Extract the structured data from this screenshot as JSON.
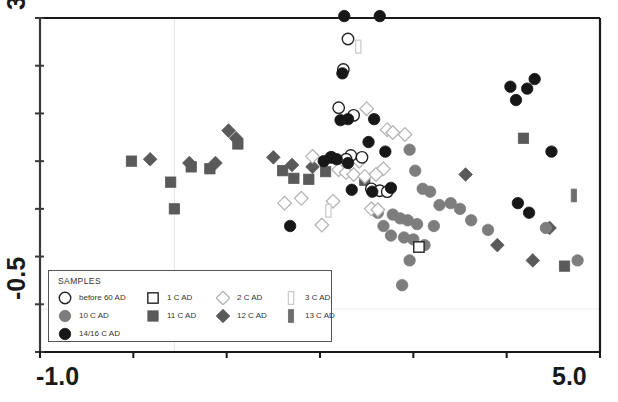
{
  "figure": {
    "top_fragment": "",
    "frame": {
      "left": 40,
      "top": 18,
      "right": 600,
      "bottom": 352
    }
  },
  "axes": {
    "x": {
      "min_label": "-1.0",
      "max_label": "5.0",
      "min": -1.0,
      "max": 5.0,
      "ticks": 7
    },
    "y": {
      "max_label": "3.0",
      "min_label": "-0.5",
      "min": -0.5,
      "max": 3.0,
      "ticks": 8
    },
    "gridline_x": 0.44,
    "gridline_y": -0.05
  },
  "legend": {
    "title": "SAMPLES",
    "items": [
      {
        "label": "before 60 AD",
        "key": "before60",
        "marker": "open-circle",
        "fill": "#ffffff",
        "stroke": "#222222"
      },
      {
        "label": "1 C AD",
        "key": "c1",
        "marker": "open-square",
        "fill": "#ffffff",
        "stroke": "#222222"
      },
      {
        "label": "2 C AD",
        "key": "c2",
        "marker": "open-diamond",
        "fill": "#ffffff",
        "stroke": "#b5b5b5"
      },
      {
        "label": "3 C AD",
        "key": "c3",
        "marker": "open-vbar",
        "fill": "#ffffff",
        "stroke": "#cccccc"
      },
      {
        "label": "10 C AD",
        "key": "c10",
        "marker": "circle",
        "fill": "#7d7d7d",
        "stroke": "#7d7d7d"
      },
      {
        "label": "11 C AD",
        "key": "c11",
        "marker": "square",
        "fill": "#5a5a5a",
        "stroke": "#5a5a5a"
      },
      {
        "label": "12 C AD",
        "key": "c12",
        "marker": "diamond",
        "fill": "#5a5a5a",
        "stroke": "#5a5a5a"
      },
      {
        "label": "13 C AD",
        "key": "c13",
        "marker": "vbar",
        "fill": "#6e6e6e",
        "stroke": "#6e6e6e"
      },
      {
        "label": "14/16 C AD",
        "key": "c1416",
        "marker": "circle",
        "fill": "#171717",
        "stroke": "#171717"
      }
    ]
  },
  "chart_data": {
    "type": "scatter",
    "title": "",
    "xlabel": "",
    "ylabel": "",
    "xlim": [
      -1.0,
      5.0
    ],
    "ylim": [
      -0.5,
      3.0
    ],
    "grid": true,
    "legend_position": "bottom-left",
    "series": [
      {
        "name": "before 60 AD",
        "key": "before60",
        "marker": "open-circle",
        "fill": "#ffffff",
        "stroke": "#222222",
        "points": [
          [
            2.3,
            2.78
          ],
          [
            2.25,
            2.46
          ],
          [
            2.2,
            2.06
          ],
          [
            2.36,
            1.98
          ],
          [
            2.33,
            1.56
          ],
          [
            2.45,
            1.54
          ],
          [
            2.12,
            1.54
          ],
          [
            2.28,
            1.52
          ],
          [
            2.55,
            1.21
          ],
          [
            2.64,
            1.19
          ],
          [
            2.72,
            1.18
          ]
        ]
      },
      {
        "name": "1 C AD",
        "key": "c1",
        "marker": "open-square",
        "fill": "#ffffff",
        "stroke": "#222222",
        "points": [
          [
            3.06,
            0.6
          ]
        ]
      },
      {
        "name": "2 C AD",
        "key": "c2",
        "marker": "open-diamond",
        "fill": "#ffffff",
        "stroke": "#b5b5b5",
        "points": [
          [
            2.5,
            2.05
          ],
          [
            2.72,
            1.83
          ],
          [
            2.78,
            1.8
          ],
          [
            2.91,
            1.78
          ],
          [
            1.92,
            1.55
          ],
          [
            2.42,
            1.5
          ],
          [
            2.2,
            1.41
          ],
          [
            2.28,
            1.38
          ],
          [
            2.36,
            1.36
          ],
          [
            1.8,
            1.11
          ],
          [
            2.14,
            1.08
          ],
          [
            2.55,
            1.0
          ],
          [
            2.62,
            0.99
          ],
          [
            2.68,
            1.42
          ],
          [
            2.48,
            1.34
          ],
          [
            2.02,
            0.83
          ],
          [
            1.62,
            1.06
          ],
          [
            2.6,
            1.36
          ]
        ]
      },
      {
        "name": "3 C AD",
        "key": "c3",
        "marker": "open-vbar",
        "fill": "#ffffff",
        "stroke": "#cccccc",
        "points": [
          [
            2.41,
            2.7
          ],
          [
            2.09,
            0.98
          ]
        ]
      },
      {
        "name": "10 C AD",
        "key": "c10",
        "marker": "circle",
        "fill": "#7d7d7d",
        "stroke": "#7d7d7d",
        "points": [
          [
            2.96,
            1.62
          ],
          [
            3.02,
            1.4
          ],
          [
            3.1,
            1.21
          ],
          [
            3.18,
            1.18
          ],
          [
            3.28,
            1.04
          ],
          [
            3.4,
            1.06
          ],
          [
            3.5,
            1.0
          ],
          [
            2.78,
            0.94
          ],
          [
            2.86,
            0.9
          ],
          [
            2.94,
            0.88
          ],
          [
            3.04,
            0.84
          ],
          [
            2.68,
            0.82
          ],
          [
            2.76,
            0.72
          ],
          [
            2.9,
            0.7
          ],
          [
            3.0,
            0.68
          ],
          [
            3.22,
            0.82
          ],
          [
            3.12,
            0.62
          ],
          [
            2.96,
            0.46
          ],
          [
            2.88,
            0.2
          ],
          [
            4.42,
            0.8
          ],
          [
            4.76,
            0.46
          ],
          [
            3.8,
            0.78
          ],
          [
            3.62,
            0.88
          ],
          [
            2.62,
            0.96
          ]
        ]
      },
      {
        "name": "11 C AD",
        "key": "c11",
        "marker": "square",
        "fill": "#5a5a5a",
        "stroke": "#5a5a5a",
        "points": [
          [
            -0.02,
            1.5
          ],
          [
            0.4,
            1.28
          ],
          [
            0.44,
            1.0
          ],
          [
            1.12,
            1.68
          ],
          [
            1.6,
            1.4
          ],
          [
            1.72,
            1.32
          ],
          [
            2.06,
            1.39
          ],
          [
            2.48,
            1.3
          ],
          [
            4.18,
            1.74
          ],
          [
            4.62,
            0.4
          ],
          [
            0.82,
            1.42
          ],
          [
            1.88,
            1.31
          ],
          [
            0.62,
            1.44
          ]
        ]
      },
      {
        "name": "12 C AD",
        "key": "c12",
        "marker": "diamond",
        "fill": "#5a5a5a",
        "stroke": "#5a5a5a",
        "points": [
          [
            0.18,
            1.52
          ],
          [
            0.6,
            1.48
          ],
          [
            1.02,
            1.82
          ],
          [
            1.1,
            1.74
          ],
          [
            1.5,
            1.54
          ],
          [
            1.7,
            1.46
          ],
          [
            1.92,
            1.44
          ],
          [
            0.88,
            1.48
          ],
          [
            3.56,
            1.36
          ],
          [
            4.46,
            0.8
          ],
          [
            3.9,
            0.62
          ],
          [
            4.28,
            0.46
          ]
        ]
      },
      {
        "name": "13 C AD",
        "key": "c13",
        "marker": "vbar",
        "fill": "#6e6e6e",
        "stroke": "#6e6e6e",
        "points": [
          [
            4.72,
            1.14
          ]
        ]
      },
      {
        "name": "14/16 C AD",
        "key": "c1416",
        "marker": "circle",
        "fill": "#171717",
        "stroke": "#171717",
        "points": [
          [
            2.26,
            3.02
          ],
          [
            2.64,
            3.02
          ],
          [
            2.24,
            2.42
          ],
          [
            2.3,
            1.94
          ],
          [
            2.22,
            1.93
          ],
          [
            2.58,
            1.94
          ],
          [
            2.52,
            1.7
          ],
          [
            2.7,
            1.6
          ],
          [
            2.12,
            1.54
          ],
          [
            2.18,
            1.52
          ],
          [
            2.04,
            1.5
          ],
          [
            2.3,
            1.48
          ],
          [
            2.34,
            1.2
          ],
          [
            1.68,
            0.82
          ],
          [
            2.56,
            1.18
          ],
          [
            4.04,
            2.28
          ],
          [
            4.22,
            2.26
          ],
          [
            4.3,
            2.36
          ],
          [
            4.1,
            2.14
          ],
          [
            4.48,
            1.6
          ],
          [
            4.12,
            1.06
          ],
          [
            4.24,
            0.96
          ],
          [
            2.76,
            1.22
          ]
        ]
      }
    ]
  }
}
